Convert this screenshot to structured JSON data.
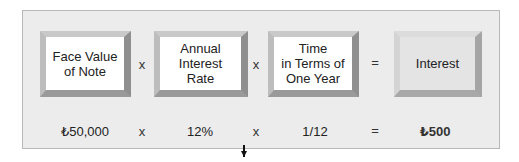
{
  "formula": {
    "terms": [
      {
        "label": "Face Value\nof Note",
        "value": "₺50,000"
      },
      {
        "label": "Annual\nInterest\nRate",
        "value": "12%"
      },
      {
        "label": "Time\nin Terms of\nOne Year",
        "value": "1/12"
      }
    ],
    "result": {
      "label": "Interest",
      "value": "₺500"
    },
    "operators": [
      "×",
      "×",
      "="
    ],
    "lines": {
      "t0": [
        "Face Value",
        "of Note"
      ],
      "t1": [
        "Annual",
        "Interest",
        "Rate"
      ],
      "t2": [
        "Time",
        "in Terms of",
        "One Year"
      ]
    },
    "op_glyphs": {
      "times": "x",
      "equals": "="
    }
  },
  "colors": {
    "panel": "#ececec",
    "box": "#ffffff",
    "result_box": "#e4e4e4",
    "bevel_dark": "#8f8f8f"
  }
}
